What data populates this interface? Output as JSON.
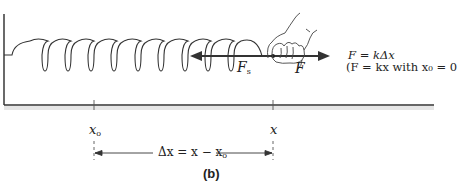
{
  "figure": {
    "panel_label": "(b)",
    "colors": {
      "line": "#333333",
      "arrow": "#333333",
      "background": "#ffffff"
    },
    "spring": {
      "coil_count": 9,
      "wall": "left-vertical-wall"
    },
    "forces": {
      "spring_force_label": "F",
      "spring_force_subscript": "s",
      "applied_force_label": "F"
    },
    "equations": {
      "line1": "F = kΔx",
      "line2": "(F = kx  with x₀ = 0"
    },
    "axis": {
      "x0_label": "x",
      "x0_subscript": "o",
      "x_label": "x",
      "delta_label": "Δx = x − x",
      "delta_subscript": "o"
    }
  }
}
